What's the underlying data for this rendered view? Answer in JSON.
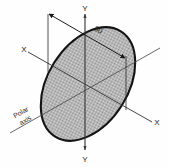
{
  "figure": {
    "background_color": "#fefefe",
    "ink_color": "#1a1a1a"
  },
  "shape": {
    "name": "ellipse",
    "fill_pattern": "halftone-gray",
    "fill_color": "#b4b4b4",
    "outline_color": "#141414",
    "center_x": 88,
    "center_y": 84,
    "semi_major": 62,
    "semi_minor": 40,
    "rotation_deg": -58
  },
  "axes": {
    "vertical": {
      "name": "Y",
      "top_label": "Y",
      "bottom_label": "Y",
      "color": "#3a3a3a"
    },
    "horizontal": {
      "name": "X",
      "left_label": "X",
      "right_label": "X",
      "color": "#3a3a3a"
    },
    "polar": {
      "label_line_1": "Polar",
      "label_line_2": "axis",
      "color": "#4a4a4a"
    }
  },
  "dimension": {
    "value": "80",
    "label": "80",
    "arrow_style": "double-ended",
    "color": "#1a1a1a"
  }
}
